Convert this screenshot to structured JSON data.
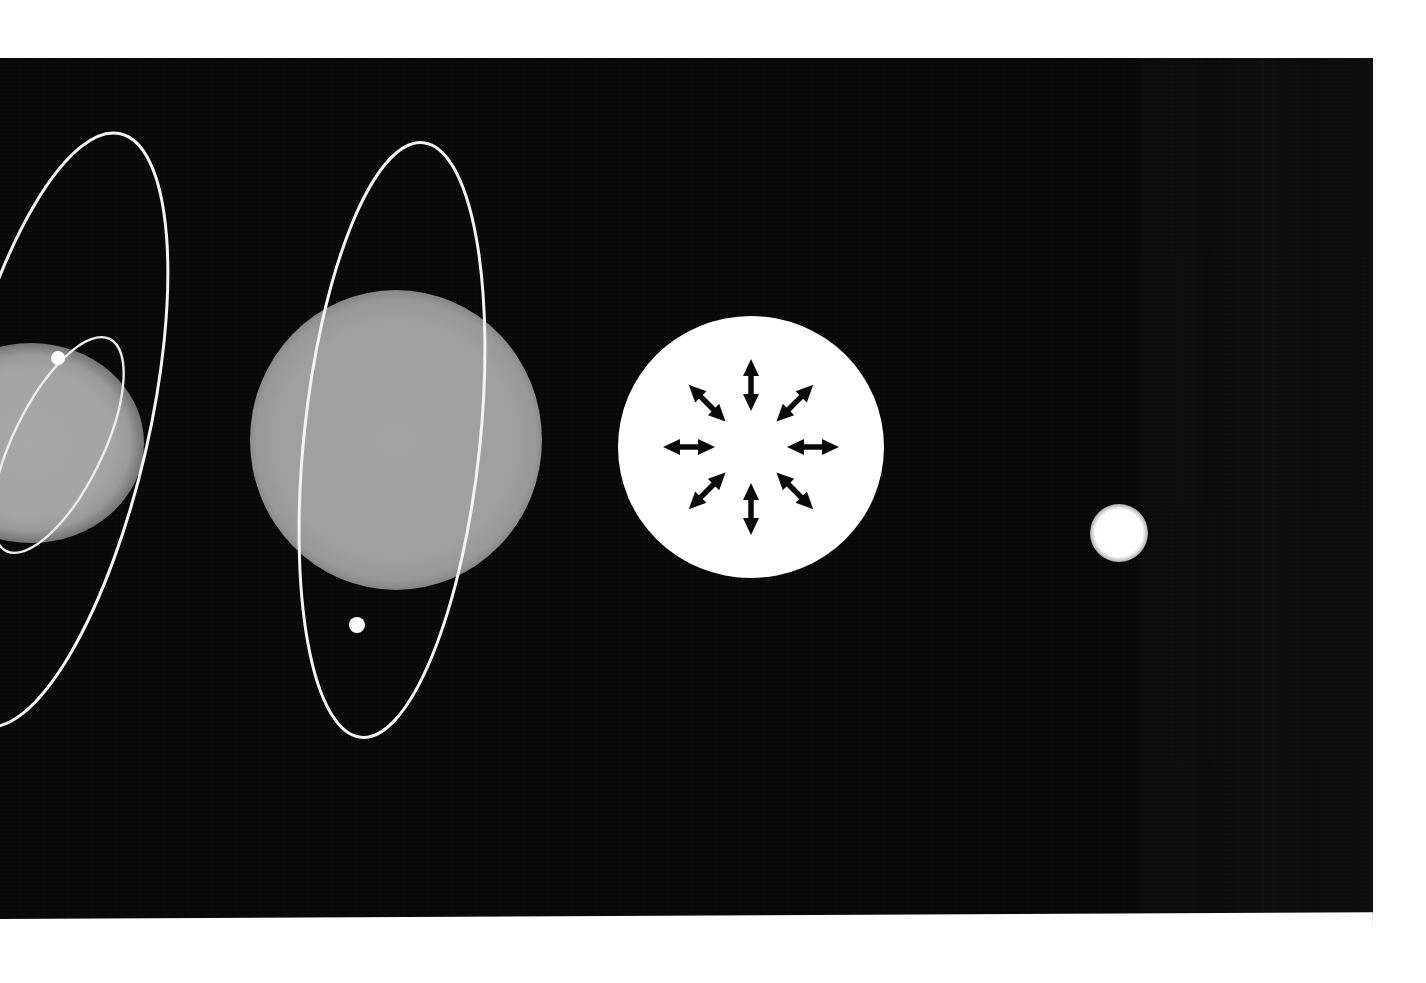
{
  "figure": {
    "medium": "scanned halftone plate",
    "background_color": "#080808",
    "page_color": "#fefefe",
    "plate": {
      "x": 0,
      "y": 58,
      "width": 1373,
      "height": 869
    }
  },
  "palette": {
    "space_black": "#080808",
    "star_gray": "#a0a0a0",
    "star_white": "#ffffff",
    "orbit_white": "#f4f4f4",
    "arrow_black": "#0a0a0a",
    "paper_white": "#fefefe"
  },
  "bodies": [
    {
      "id": "body-1",
      "name": "gray-giant-partial",
      "kind": "sphere",
      "fill": "gray",
      "center_x": 31,
      "center_y": 385,
      "radius_x": 113,
      "radius_y": 100,
      "cropped_by_frame": "left",
      "has_orbits": true
    },
    {
      "id": "body-2",
      "name": "gray-giant",
      "kind": "sphere",
      "fill": "gray",
      "center_x": 396,
      "center_y": 382,
      "radius_x": 146,
      "radius_y": 150,
      "cropped_by_frame": "none",
      "has_orbits": true
    },
    {
      "id": "body-3",
      "name": "white-radiating-star",
      "kind": "sphere",
      "fill": "white",
      "center_x": 751,
      "center_y": 389,
      "radius_x": 133,
      "radius_y": 131,
      "cropped_by_frame": "none",
      "has_orbits": false
    },
    {
      "id": "body-4",
      "name": "white-dwarf",
      "kind": "sphere",
      "fill": "white",
      "center_x": 1119,
      "center_y": 475,
      "radius_x": 29,
      "radius_y": 29,
      "cropped_by_frame": "none",
      "has_orbits": false
    }
  ],
  "orbits": [
    {
      "id": "orbit-outer-left",
      "name": "outer-orbit-left",
      "around_body": "body-1",
      "center_x": 52,
      "center_y": 372,
      "semi_major": 304,
      "semi_minor": 96,
      "rotation_deg": 13,
      "stroke": "#f4f4f4",
      "stroke_width": 3,
      "has_marker": false
    },
    {
      "id": "orbit-inner-left",
      "name": "inner-orbit-left",
      "around_body": "body-1",
      "center_x": 58,
      "center_y": 387,
      "semi_major": 118,
      "semi_minor": 45,
      "rotation_deg": 26,
      "stroke": "#ececec",
      "stroke_width": 2.4,
      "has_marker": true,
      "marker": {
        "name": "orbiting-body-dot",
        "x": 58,
        "y": 300,
        "radius": 7
      }
    },
    {
      "id": "orbit-body-2",
      "name": "orbit-around-gray-giant",
      "around_body": "body-2",
      "center_x": 392,
      "center_y": 382,
      "semi_major": 299,
      "semi_minor": 88,
      "rotation_deg": 6,
      "stroke": "#f4f4f4",
      "stroke_width": 3,
      "has_marker": true,
      "marker": {
        "name": "orbiting-body-dot",
        "x": 357,
        "y": 567,
        "radius": 8
      }
    }
  ],
  "radiation_arrows": {
    "name": "outward-radiation-pressure-arrows",
    "around_body": "body-3",
    "count": 8,
    "style": "double-headed",
    "inner_radius": 36,
    "outer_radius": 88,
    "head_length": 17,
    "head_half_width": 8,
    "shaft_width": 5.5,
    "color": "#0a0a0a",
    "angles_deg": [
      270,
      315,
      0,
      45,
      90,
      135,
      180,
      225
    ],
    "direction_labels": [
      "N",
      "NE",
      "E",
      "SE",
      "S",
      "SW",
      "W",
      "NW"
    ]
  }
}
